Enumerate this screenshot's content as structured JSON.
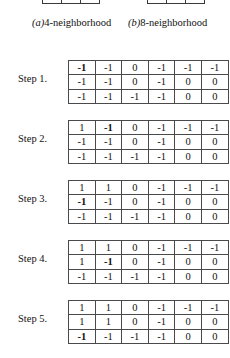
{
  "figure": {
    "neighborhoods": [
      {
        "name": "4-neighborhood",
        "tag": "(a)",
        "caption_prefix": "(a)",
        "caption_text": "4-neighborhood",
        "cells": [
          "",
          "4",
          ""
        ]
      },
      {
        "name": "8-neighborhood",
        "tag": "(b)",
        "caption_prefix": "(b)",
        "caption_text": "8-neighborhood",
        "cells": [
          "6",
          "7",
          "8"
        ]
      }
    ]
  },
  "steps": [
    {
      "label": "Step 1.",
      "rows": [
        [
          {
            "v": "-1",
            "bold": true
          },
          {
            "v": "-1",
            "bold": false
          },
          {
            "v": "0",
            "bold": false
          },
          {
            "v": "-1",
            "bold": false
          },
          {
            "v": "-1",
            "bold": false
          },
          {
            "v": "-1",
            "bold": false
          }
        ],
        [
          {
            "v": "-1",
            "bold": false
          },
          {
            "v": "-1",
            "bold": false
          },
          {
            "v": "0",
            "bold": false
          },
          {
            "v": "-1",
            "bold": false
          },
          {
            "v": "0",
            "bold": false
          },
          {
            "v": "0",
            "bold": false
          }
        ],
        [
          {
            "v": "-1",
            "bold": false
          },
          {
            "v": "-1",
            "bold": false
          },
          {
            "v": "-1",
            "bold": false
          },
          {
            "v": "-1",
            "bold": false
          },
          {
            "v": "0",
            "bold": false
          },
          {
            "v": "0",
            "bold": false
          }
        ]
      ]
    },
    {
      "label": "Step 2.",
      "rows": [
        [
          {
            "v": "1",
            "bold": false
          },
          {
            "v": "-1",
            "bold": true
          },
          {
            "v": "0",
            "bold": false
          },
          {
            "v": "-1",
            "bold": false
          },
          {
            "v": "-1",
            "bold": false
          },
          {
            "v": "-1",
            "bold": false
          }
        ],
        [
          {
            "v": "-1",
            "bold": false
          },
          {
            "v": "-1",
            "bold": false
          },
          {
            "v": "0",
            "bold": false
          },
          {
            "v": "-1",
            "bold": false
          },
          {
            "v": "0",
            "bold": false
          },
          {
            "v": "0",
            "bold": false
          }
        ],
        [
          {
            "v": "-1",
            "bold": false
          },
          {
            "v": "-1",
            "bold": false
          },
          {
            "v": "-1",
            "bold": false
          },
          {
            "v": "-1",
            "bold": false
          },
          {
            "v": "0",
            "bold": false
          },
          {
            "v": "0",
            "bold": false
          }
        ]
      ]
    },
    {
      "label": "Step 3.",
      "rows": [
        [
          {
            "v": "1",
            "bold": false
          },
          {
            "v": "1",
            "bold": false
          },
          {
            "v": "0",
            "bold": false
          },
          {
            "v": "-1",
            "bold": false
          },
          {
            "v": "-1",
            "bold": false
          },
          {
            "v": "-1",
            "bold": false
          }
        ],
        [
          {
            "v": "-1",
            "bold": true
          },
          {
            "v": "-1",
            "bold": false
          },
          {
            "v": "0",
            "bold": false
          },
          {
            "v": "-1",
            "bold": false
          },
          {
            "v": "0",
            "bold": false
          },
          {
            "v": "0",
            "bold": false
          }
        ],
        [
          {
            "v": "-1",
            "bold": false
          },
          {
            "v": "-1",
            "bold": false
          },
          {
            "v": "-1",
            "bold": false
          },
          {
            "v": "-1",
            "bold": false
          },
          {
            "v": "0",
            "bold": false
          },
          {
            "v": "0",
            "bold": false
          }
        ]
      ]
    },
    {
      "label": "Step 4.",
      "rows": [
        [
          {
            "v": "1",
            "bold": false
          },
          {
            "v": "1",
            "bold": false
          },
          {
            "v": "0",
            "bold": false
          },
          {
            "v": "-1",
            "bold": false
          },
          {
            "v": "-1",
            "bold": false
          },
          {
            "v": "-1",
            "bold": false
          }
        ],
        [
          {
            "v": "1",
            "bold": false
          },
          {
            "v": "-1",
            "bold": true
          },
          {
            "v": "0",
            "bold": false
          },
          {
            "v": "-1",
            "bold": false
          },
          {
            "v": "0",
            "bold": false
          },
          {
            "v": "0",
            "bold": false
          }
        ],
        [
          {
            "v": "-1",
            "bold": false
          },
          {
            "v": "-1",
            "bold": false
          },
          {
            "v": "-1",
            "bold": false
          },
          {
            "v": "-1",
            "bold": false
          },
          {
            "v": "0",
            "bold": false
          },
          {
            "v": "0",
            "bold": false
          }
        ]
      ]
    },
    {
      "label": "Step 5.",
      "rows": [
        [
          {
            "v": "1",
            "bold": false
          },
          {
            "v": "1",
            "bold": false
          },
          {
            "v": "0",
            "bold": false
          },
          {
            "v": "-1",
            "bold": false
          },
          {
            "v": "-1",
            "bold": false
          },
          {
            "v": "-1",
            "bold": false
          }
        ],
        [
          {
            "v": "1",
            "bold": false
          },
          {
            "v": "1",
            "bold": false
          },
          {
            "v": "0",
            "bold": false
          },
          {
            "v": "-1",
            "bold": false
          },
          {
            "v": "0",
            "bold": false
          },
          {
            "v": "0",
            "bold": false
          }
        ],
        [
          {
            "v": "-1",
            "bold": true
          },
          {
            "v": "-1",
            "bold": false
          },
          {
            "v": "-1",
            "bold": false
          },
          {
            "v": "-1",
            "bold": false
          },
          {
            "v": "0",
            "bold": false
          },
          {
            "v": "0",
            "bold": false
          }
        ]
      ]
    }
  ],
  "layout": {
    "step_row_tops": [
      58,
      118,
      178,
      238,
      298
    ]
  },
  "colors": {
    "text": "#111111",
    "border": "#4a4a4a",
    "background": "#ffffff"
  }
}
